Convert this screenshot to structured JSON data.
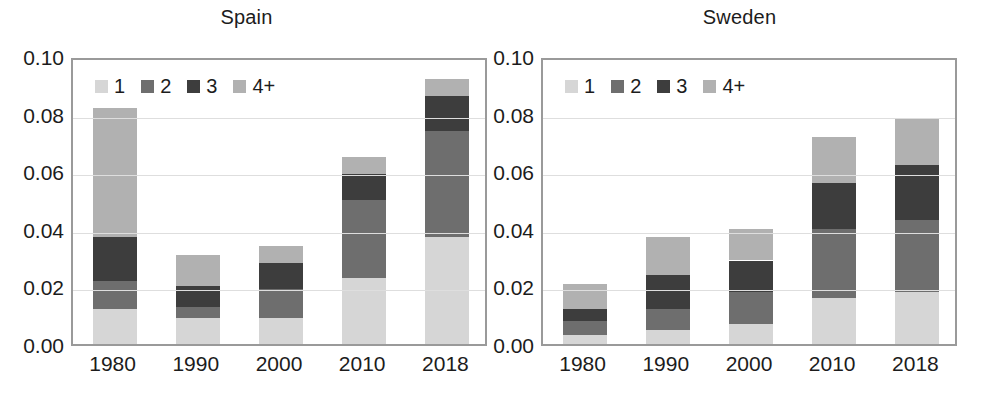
{
  "figure": {
    "width": 987,
    "height": 402,
    "background": "#ffffff"
  },
  "legend": {
    "entries": [
      {
        "label": "1",
        "color": "#d6d6d6"
      },
      {
        "label": "2",
        "color": "#6e6e6e"
      },
      {
        "label": "3",
        "color": "#3d3d3d"
      },
      {
        "label": "4+",
        "color": "#b1b1b1"
      }
    ]
  },
  "axis": {
    "y_ticks": [
      "0.00",
      "0.02",
      "0.04",
      "0.06",
      "0.08",
      "0.10"
    ],
    "y_values": [
      0.0,
      0.02,
      0.04,
      0.06,
      0.08,
      0.1
    ],
    "x_ticks": [
      "1980",
      "1990",
      "2000",
      "2010",
      "2018"
    ]
  },
  "chart_data": [
    {
      "type": "bar",
      "title": "Spain",
      "subtitle": "",
      "xlabel": "",
      "ylabel": "",
      "stacked": true,
      "grid": true,
      "legend_position": "top-left-inside",
      "ylim": [
        0.0,
        0.1
      ],
      "yticks": [
        0.0,
        0.02,
        0.04,
        0.06,
        0.08,
        0.1
      ],
      "categories": [
        "1980",
        "1990",
        "2000",
        "2010",
        "2018"
      ],
      "series": [
        {
          "name": "1",
          "color": "#d6d6d6",
          "values": [
            0.012,
            0.009,
            0.009,
            0.023,
            0.037
          ]
        },
        {
          "name": "2",
          "color": "#6e6e6e",
          "values": [
            0.01,
            0.004,
            0.01,
            0.027,
            0.037
          ]
        },
        {
          "name": "3",
          "color": "#3d3d3d",
          "values": [
            0.015,
            0.007,
            0.009,
            0.009,
            0.012
          ]
        },
        {
          "name": "4+",
          "color": "#b1b1b1",
          "values": [
            0.045,
            0.011,
            0.006,
            0.006,
            0.006
          ]
        }
      ],
      "totals": [
        0.082,
        0.031,
        0.034,
        0.065,
        0.092
      ]
    },
    {
      "type": "bar",
      "title": "Sweden",
      "subtitle": "",
      "xlabel": "",
      "ylabel": "",
      "stacked": true,
      "grid": true,
      "legend_position": "top-left-inside",
      "ylim": [
        0.0,
        0.1
      ],
      "yticks": [
        0.0,
        0.02,
        0.04,
        0.06,
        0.08,
        0.1
      ],
      "categories": [
        "1980",
        "1990",
        "2000",
        "2010",
        "2018"
      ],
      "series": [
        {
          "name": "1",
          "color": "#d6d6d6",
          "values": [
            0.003,
            0.005,
            0.007,
            0.016,
            0.018
          ]
        },
        {
          "name": "2",
          "color": "#6e6e6e",
          "values": [
            0.005,
            0.007,
            0.011,
            0.024,
            0.025
          ]
        },
        {
          "name": "3",
          "color": "#3d3d3d",
          "values": [
            0.004,
            0.012,
            0.011,
            0.016,
            0.019
          ]
        },
        {
          "name": "4+",
          "color": "#b1b1b1",
          "values": [
            0.009,
            0.013,
            0.011,
            0.016,
            0.016
          ]
        }
      ],
      "totals": [
        0.021,
        0.037,
        0.04,
        0.072,
        0.078
      ]
    }
  ],
  "panels": {
    "left": {
      "title": "Spain"
    },
    "right": {
      "title": "Sweden"
    }
  }
}
